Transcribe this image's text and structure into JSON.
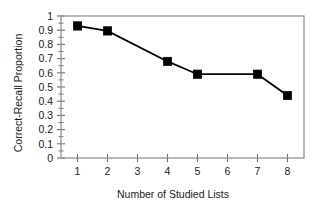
{
  "chart_data": {
    "type": "line",
    "title": "",
    "subtitle": "",
    "xlabel": "Number of Studied Lists",
    "ylabel": "Correct-Recall Proportion",
    "x": [
      1,
      2,
      4,
      5,
      7,
      8
    ],
    "values": [
      0.93,
      0.895,
      0.68,
      0.59,
      0.59,
      0.44
    ],
    "series": [
      {
        "name": "Correct-Recall Proportion",
        "x": [
          1,
          2,
          4,
          5,
          7,
          8
        ],
        "values": [
          0.93,
          0.895,
          0.68,
          0.59,
          0.59,
          0.44
        ],
        "marker": "filled-square",
        "color": "#000000"
      }
    ],
    "xlim": [
      0.45,
      8.55
    ],
    "ylim": [
      0,
      1
    ],
    "xticks": [
      1,
      2,
      3,
      4,
      5,
      6,
      7,
      8
    ],
    "xticklabels": [
      "1",
      "2",
      "3",
      "4",
      "5",
      "6",
      "7",
      "8"
    ],
    "yticks": [
      0,
      0.1,
      0.2,
      0.3,
      0.4,
      0.5,
      0.6,
      0.7,
      0.8,
      0.9,
      1
    ],
    "yticklabels": [
      "0",
      "0.1",
      "0.2",
      "0.3",
      "0.4",
      "0.5",
      "0.6",
      "0.7",
      "0.8",
      "0.9",
      "1"
    ],
    "y_minor_ticks": [
      0.05,
      0.15,
      0.25,
      0.35,
      0.45,
      0.55,
      0.65,
      0.75,
      0.85,
      0.95
    ],
    "grid": false,
    "legend": null,
    "legend_position": "none",
    "frame": "box",
    "annotations": []
  },
  "axis": {
    "y_title": "Correct-Recall Proportion",
    "x_title": "Number of Studied Lists"
  },
  "colors": {
    "line": "#000000",
    "marker": "#000000",
    "frame": "#8c8c8c",
    "tick": "#6e6e6e",
    "text": "#1a1a1a",
    "background": "#ffffff"
  }
}
